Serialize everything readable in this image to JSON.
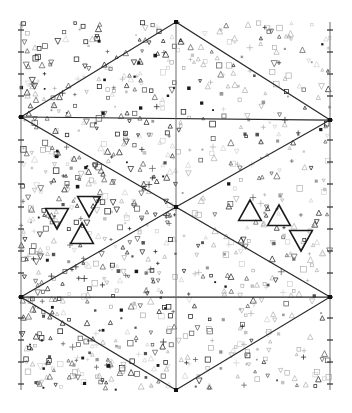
{
  "figure": {
    "background_color": "#ffffff",
    "width": 352,
    "height": 413,
    "line_color_structure": "#2a2a2a",
    "line_color_frame": "#7a7a7a",
    "marker_color_dark": "#1a1a1a",
    "marker_color_mid": "#555555",
    "marker_color_light": "#9a9a9a",
    "marker_color_faint": "#c4c4c4"
  },
  "frame": {
    "left_x": 21,
    "right_x": 330,
    "top_y": 22,
    "bottom_y": 390,
    "center_x": 176,
    "center_y": 207
  },
  "hexagram": {
    "description": "Two overlapping large triangles forming a six-pointed star / rhombus tiling",
    "vertices": {
      "top": [
        176,
        22
      ],
      "left_upper": [
        21,
        117
      ],
      "right_upper": [
        330,
        120
      ],
      "left_lower": [
        21,
        297
      ],
      "right_lower": [
        330,
        297
      ],
      "bottom": [
        176,
        390
      ],
      "center": [
        176,
        207
      ]
    },
    "edges": [
      [
        [
          176,
          22
        ],
        [
          21,
          117
        ]
      ],
      [
        [
          176,
          22
        ],
        [
          330,
          120
        ]
      ],
      [
        [
          21,
          117
        ],
        [
          330,
          120
        ]
      ],
      [
        [
          21,
          117
        ],
        [
          176,
          207
        ]
      ],
      [
        [
          330,
          120
        ],
        [
          176,
          207
        ]
      ],
      [
        [
          176,
          207
        ],
        [
          21,
          297
        ]
      ],
      [
        [
          176,
          207
        ],
        [
          330,
          297
        ]
      ],
      [
        [
          21,
          297
        ],
        [
          330,
          297
        ]
      ],
      [
        [
          21,
          297
        ],
        [
          176,
          390
        ]
      ],
      [
        [
          330,
          297
        ],
        [
          176,
          390
        ]
      ]
    ],
    "center_vertical_line": [
      [
        176,
        22
      ],
      [
        176,
        390
      ]
    ]
  },
  "highlighted_markers": {
    "count": 6,
    "left_cluster": [
      {
        "id": "L1",
        "shape": "triangle-down",
        "cx": 57,
        "cy": 218,
        "size": 22
      },
      {
        "id": "L2",
        "shape": "triangle-down",
        "cx": 89,
        "cy": 206,
        "size": 22
      },
      {
        "id": "L3",
        "shape": "triangle-up",
        "cx": 82,
        "cy": 234,
        "size": 22
      }
    ],
    "right_cluster": [
      {
        "id": "R1",
        "shape": "triangle-up",
        "cx": 250,
        "cy": 211,
        "size": 22
      },
      {
        "id": "R2",
        "shape": "triangle-up",
        "cx": 279,
        "cy": 216,
        "size": 22
      },
      {
        "id": "R3",
        "shape": "triangle-down",
        "cx": 301,
        "cy": 240,
        "size": 22
      }
    ]
  },
  "scatter": {
    "description": "Dense random field of small glyph markers filling the frame",
    "glyph_types": [
      "triangle-up",
      "triangle-down",
      "square",
      "plus",
      "dot"
    ],
    "approx_count": 980,
    "seed": 20240517,
    "region_density": {
      "upper_left": 1.0,
      "upper_right": 0.62,
      "lower_left": 1.0,
      "lower_right": 0.66
    },
    "region_darkness": {
      "upper_left": 1.0,
      "upper_right": 0.55,
      "lower_left": 0.95,
      "lower_right": 0.58
    }
  },
  "tick_marks": {
    "description": "Small perpendicular tick marks along the left and right frame lines",
    "left_ticks_y": [
      30,
      52,
      74,
      96,
      117,
      140,
      162,
      184,
      207,
      229,
      251,
      273,
      297,
      318,
      340,
      362,
      384
    ],
    "right_ticks_y": [
      30,
      52,
      74,
      96,
      120,
      140,
      162,
      184,
      207,
      229,
      251,
      273,
      297,
      318,
      340,
      362,
      384
    ]
  }
}
